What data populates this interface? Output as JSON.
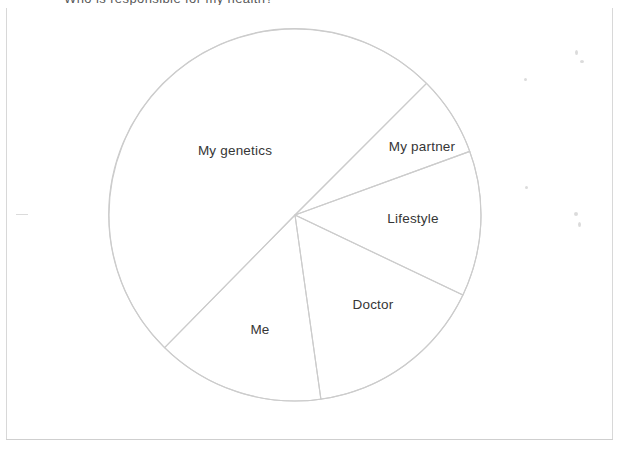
{
  "page": {
    "background_color": "#ffffff",
    "frame_color": "#d8d8d8",
    "cropped_heading": "Who is responsible for my health?"
  },
  "chart_data": {
    "type": "pie",
    "title": "",
    "subtitle": "",
    "xlabel": "",
    "ylabel": "",
    "legend_position": "none",
    "grid": false,
    "labels_inside": true,
    "stroke_color": "#cccccc",
    "fill_color": "#ffffff",
    "center": {
      "x": 295,
      "y": 215
    },
    "radius": 186,
    "categories": [
      "My genetics",
      "My partner",
      "Lifestyle",
      "Doctor",
      "Me"
    ],
    "values": [
      180.5,
      25.0,
      45.5,
      56.5,
      52.5
    ],
    "value_unit": "degrees",
    "percentages": [
      50.1,
      6.9,
      12.6,
      15.7,
      14.6
    ],
    "slices": [
      {
        "label": "My genetics",
        "start_angle_deg": 224.5,
        "end_angle_deg": 405.0,
        "sweep_deg": 180.5,
        "percent": 50.1,
        "label_x": 235,
        "label_y": 150
      },
      {
        "label": "My partner",
        "start_angle_deg": 45.0,
        "end_angle_deg": 70.0,
        "sweep_deg": 25.0,
        "percent": 6.9,
        "label_x": 422,
        "label_y": 146
      },
      {
        "label": "Lifestyle",
        "start_angle_deg": 70.0,
        "end_angle_deg": 115.5,
        "sweep_deg": 45.5,
        "percent": 12.6,
        "label_x": 413,
        "label_y": 218
      },
      {
        "label": "Doctor",
        "start_angle_deg": 115.5,
        "end_angle_deg": 172.0,
        "sweep_deg": 56.5,
        "percent": 15.7,
        "label_x": 373,
        "label_y": 304
      },
      {
        "label": "Me",
        "start_angle_deg": 172.0,
        "end_angle_deg": 224.5,
        "sweep_deg": 52.5,
        "percent": 14.6,
        "label_x": 260,
        "label_y": 329
      }
    ]
  }
}
